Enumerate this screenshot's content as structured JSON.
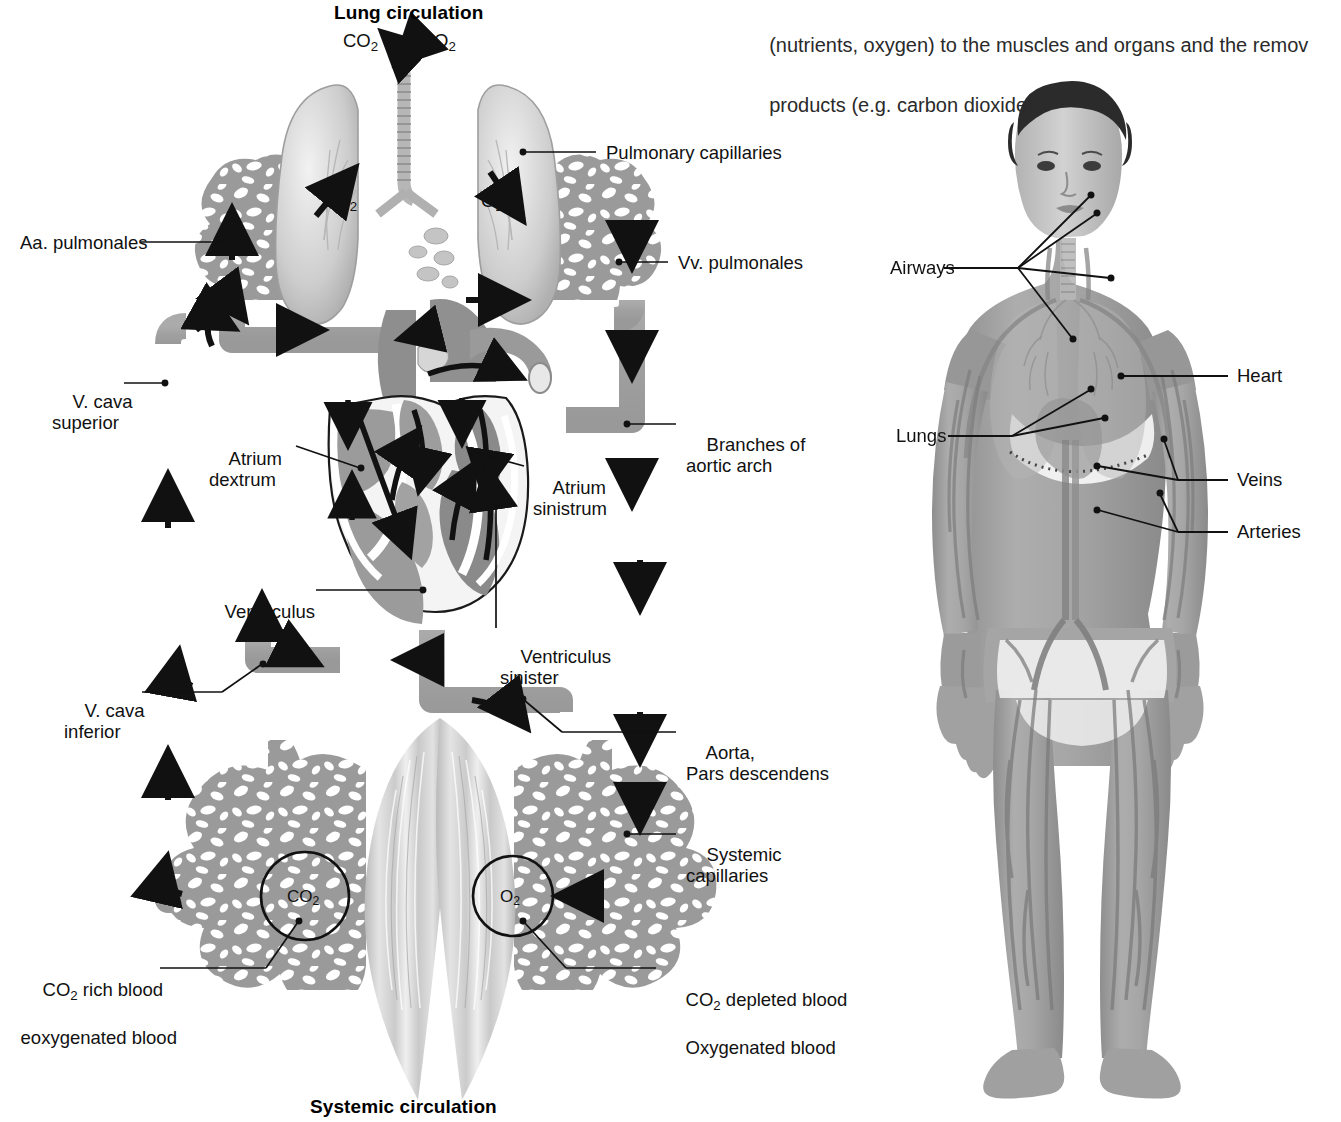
{
  "page": {
    "title_top": "Lung circulation",
    "title_bottom": "Systemic circulation",
    "body_text_line1": "(nutrients, oxygen) to the muscles and organs and the remov",
    "body_text_line2": "products (e.g. carbon dioxide)."
  },
  "gas_markers": {
    "top_co2": "CO",
    "top_co2_sub": "2",
    "top_o2": "O",
    "top_o2_sub": "2",
    "lung_left_co2": "CO",
    "lung_left_co2_sub": "2",
    "lung_right_o2": "O",
    "lung_right_o2_sub": "2",
    "cap_left_co2": "CO",
    "cap_left_co2_sub": "2",
    "cap_right_o2": "O",
    "cap_right_o2_sub": "2"
  },
  "diagram_labels": {
    "aa_pulmonales": "Aa. pulmonales",
    "vena_cava_superior_l1": "V. cava",
    "vena_cava_superior_l2": "superior",
    "atrium_dextrum_l1": "Atrium",
    "atrium_dextrum_l2": "dextrum",
    "ventriculus_dexter_l1": "Ventriculus",
    "ventriculus_dexter_l2": "dexter",
    "vena_cava_inferior_l1": "V. cava",
    "vena_cava_inferior_l2": "inferior",
    "co2_rich_l1_a": "CO",
    "co2_rich_l1_sub": "2",
    "co2_rich_l1_b": " rich blood",
    "co2_rich_l2": "eoxygenated blood",
    "pulmonary_capillaries": "Pulmonary capillaries",
    "vv_pulmonales": "Vv. pulmonales",
    "branches_aortic_l1": "Branches of",
    "branches_aortic_l2": "aortic arch",
    "atrium_sinistrum_l1": "Atrium",
    "atrium_sinistrum_l2": "sinistrum",
    "ventriculus_sinister_l1": "Ventriculus",
    "ventriculus_sinister_l2": "sinister",
    "aorta_l1": "Aorta,",
    "aorta_l2": "Pars descendens",
    "systemic_capillaries_l1": "Systemic",
    "systemic_capillaries_l2": "capillaries",
    "co2_depleted_l1_a": "CO",
    "co2_depleted_l1_sub": "2",
    "co2_depleted_l1_b": " depleted blood",
    "co2_depleted_l2": "Oxygenated blood"
  },
  "photo_labels": {
    "airways": "Airways",
    "lungs": "Lungs",
    "heart": "Heart",
    "veins": "Veins",
    "arteries": "Arteries"
  },
  "colors": {
    "vessel_gray": "#a3a3a3",
    "vessel_edge": "#8d8d8d",
    "heart_dark": "#8a8a8a",
    "heart_mid": "#9c9c9c",
    "heart_light": "#bdbdbd",
    "lung_light": "#d8d8d8",
    "capillary_gray": "#9a9a9a",
    "muscle_light": "#cfcfcf",
    "skin_gray": "#9d9d9d",
    "hair_dark": "#2b2b2b",
    "line_black": "#111111",
    "background": "#ffffff"
  }
}
